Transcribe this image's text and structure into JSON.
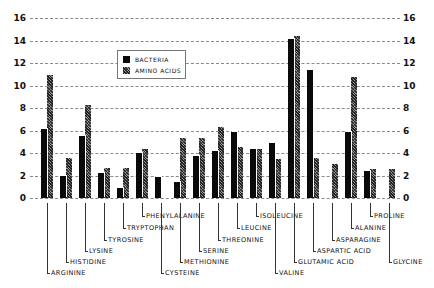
{
  "chart_data": {
    "type": "bar",
    "title": "",
    "xlabel": "",
    "ylabel": "",
    "ylim": [
      0,
      16
    ],
    "yticks": [
      0,
      2,
      4,
      6,
      8,
      10,
      12,
      14,
      16
    ],
    "grid": true,
    "legend_position": "upper-left inset",
    "categories": [
      "ARGININE",
      "HISTIDINE",
      "LYSINE",
      "TYROSINE",
      "TRYPTOPHAN",
      "PHENYLALANINE",
      "CYSTEINE",
      "METHIONINE",
      "SERINE",
      "THREONINE",
      "LEUCINE",
      "ISOLEUCINE",
      "VALINE",
      "GLUTAMIC ACID",
      "ASPARTIC ACID",
      "ASPARAGINE",
      "ALANINE",
      "PROLINE",
      "GLYCINE"
    ],
    "series": [
      {
        "name": "BACTERIA",
        "values": [
          6.1,
          2.0,
          5.5,
          2.2,
          0.9,
          4.0,
          1.9,
          1.4,
          3.7,
          4.2,
          5.9,
          4.4,
          4.9,
          14.1,
          11.4,
          0,
          5.9,
          2.4,
          0
        ]
      },
      {
        "name": "AMINO ACIDS",
        "values": [
          10.9,
          3.6,
          8.3,
          2.7,
          2.7,
          4.4,
          0,
          5.3,
          5.3,
          6.3,
          4.5,
          4.4,
          3.5,
          14.4,
          3.6,
          3.0,
          10.8,
          2.6,
          2.6
        ]
      }
    ],
    "label_levels": [
      5,
      4,
      3,
      2,
      1,
      0,
      5,
      4,
      3,
      2,
      1,
      0,
      5,
      4,
      3,
      2,
      1,
      0,
      4
    ]
  },
  "legend": {
    "bacteria_label": "BACTERIA",
    "amino_label": "AMINO ACIDS"
  }
}
